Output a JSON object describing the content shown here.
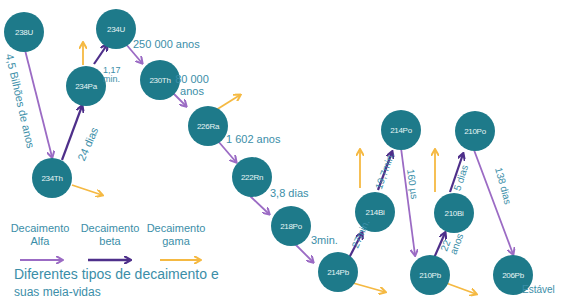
{
  "colors": {
    "node": "#1e7a8a",
    "alpha": "#9b6bc4",
    "beta": "#4e2f8a",
    "gamma": "#f5b942",
    "text": "#3b8ea8"
  },
  "nodes": {
    "u238": "238U",
    "th234": "234Th",
    "pa234": "234Pa",
    "u234": "234U",
    "th230": "230Th",
    "ra226": "226Ra",
    "rn222": "222Rn",
    "po218": "218Po",
    "pb214": "214Pb",
    "bi214": "214Bi",
    "po214": "214Po",
    "pb210": "210Pb",
    "bi210": "210Bi",
    "po210": "210Po",
    "pb206": "206Pb"
  },
  "half_lives": {
    "u238": "4,5 Bilhões de anos",
    "th234": "24 dias",
    "pa234": "1,17 min.",
    "u234": "250 000 anos",
    "th230": "80 000 anos",
    "ra226": "1 602 anos",
    "rn222": "3,8 dias",
    "po218": "3min.",
    "pb214": "27min.",
    "bi214": "19,7min.",
    "po214": "160 µs",
    "pb210": "22 anos",
    "bi210": "5 dias",
    "po210": "138 dias"
  },
  "stable_label": "Estável",
  "legend": {
    "alpha": "Decaimento Alfa",
    "alpha_l1": "Decaimento",
    "alpha_l2": "Alfa",
    "beta_l1": "Decaimento",
    "beta_l2": "beta",
    "gamma_l1": "Decaimento",
    "gamma_l2": "gama"
  },
  "caption_l1": "Diferentes tipos de decaimento e",
  "caption_l2": "suas meia-vidas"
}
